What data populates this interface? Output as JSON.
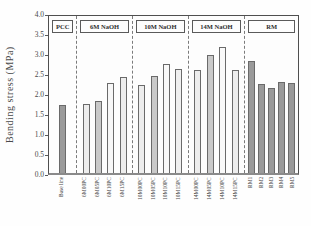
{
  "figure_title": "Bending stress bar chart",
  "chart_data": {
    "type": "bar",
    "title": "",
    "xlabel": "",
    "ylabel": "Bending stress (MPa)",
    "ylim": [
      0.0,
      4.0
    ],
    "ytick_step": 0.5,
    "yticks": [
      "4.0",
      "3.5",
      "3.0",
      "2.5",
      "2.0",
      "1.5",
      "1.0",
      "0.5",
      "0.0"
    ],
    "grid": false,
    "legend": "none",
    "group_separator_style": "dashed",
    "groups": [
      {
        "label": "PCC",
        "bars": [
          {
            "category": "Base line",
            "value": 1.7,
            "fill": "#9a9a9a"
          }
        ]
      },
      {
        "label": "6M NaOH",
        "bars": [
          {
            "category": "6M00PC",
            "value": 1.72,
            "fill": "#ededed"
          },
          {
            "category": "6M05PC",
            "value": 1.8,
            "fill": "#c9c9c9"
          },
          {
            "category": "6M10PC",
            "value": 2.25,
            "fill": "#f7f7f7"
          },
          {
            "category": "6M15PC",
            "value": 2.4,
            "fill": "#ededed"
          }
        ]
      },
      {
        "label": "10M NaOH",
        "bars": [
          {
            "category": "10M00PC",
            "value": 2.2,
            "fill": "#ededed"
          },
          {
            "category": "10M05PC",
            "value": 2.42,
            "fill": "#c9c9c9"
          },
          {
            "category": "10M10PC",
            "value": 2.73,
            "fill": "#f9f9f9"
          },
          {
            "category": "10M15PC",
            "value": 2.6,
            "fill": "#efefef"
          }
        ]
      },
      {
        "label": "14M NaOH",
        "bars": [
          {
            "category": "14M00PC",
            "value": 2.57,
            "fill": "#ededed"
          },
          {
            "category": "14M05PC",
            "value": 2.95,
            "fill": "#c9c9c9"
          },
          {
            "category": "14M10PC",
            "value": 3.15,
            "fill": "#f9f9f9"
          },
          {
            "category": "14M15PC",
            "value": 2.57,
            "fill": "#ededed"
          }
        ]
      },
      {
        "label": "RM",
        "bars": [
          {
            "category": "RM1",
            "value": 2.8,
            "fill": "#9a9a9a"
          },
          {
            "category": "RM2",
            "value": 2.22,
            "fill": "#9a9a9a"
          },
          {
            "category": "RM3",
            "value": 2.12,
            "fill": "#9a9a9a"
          },
          {
            "category": "RM4",
            "value": 2.28,
            "fill": "#9a9a9a"
          },
          {
            "category": "RM5",
            "value": 2.26,
            "fill": "#9a9a9a"
          }
        ]
      }
    ]
  }
}
